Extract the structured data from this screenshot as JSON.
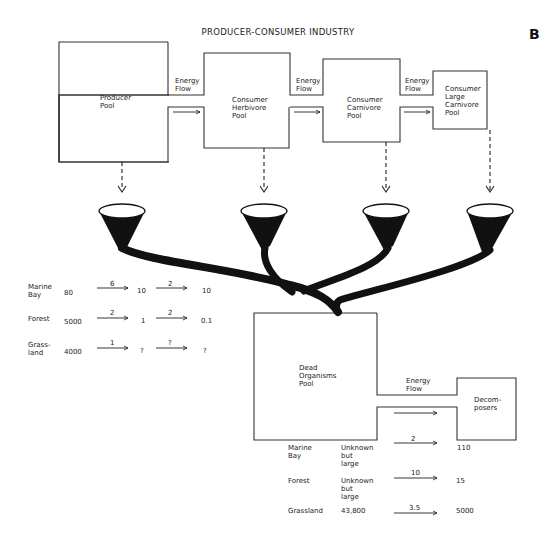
{
  "title": "PRODUCER-CONSUMER INDUSTRY",
  "panel_letter": "B",
  "pools": [
    {
      "id": "producer",
      "label": "Producer\nPool"
    },
    {
      "id": "herbivore",
      "label": "Consumer\nHerbivore\nPool"
    },
    {
      "id": "carnivore",
      "label": "Consumer\nCarnivore\nPool"
    },
    {
      "id": "large-carnivore",
      "label": "Consumer\nLarge\nCarnivore\nPool"
    },
    {
      "id": "dead",
      "label": "Dead\nOrganisms\nPool"
    },
    {
      "id": "decomposers",
      "label": "Decom-\nposers"
    }
  ],
  "energy_flow_label": "Energy\nFlow",
  "producer_consumer_table": {
    "rows": [
      {
        "ecosystem": "Marine\nBay",
        "producer": "80",
        "flow1": "6",
        "herbivore": "10",
        "flow2": "2",
        "carnivore": "10"
      },
      {
        "ecosystem": "Forest",
        "producer": "5000",
        "flow1": "2",
        "herbivore": "1",
        "flow2": "2",
        "carnivore": "0.1"
      },
      {
        "ecosystem": "Grass-\nland",
        "producer": "4000",
        "flow1": "1",
        "herbivore": "?",
        "flow2": "?",
        "carnivore": "?"
      }
    ]
  },
  "decomposer_table": {
    "rows": [
      {
        "ecosystem": "Marine\nBay",
        "dead_pool": "Unknown\nbut\nlarge",
        "flow": "2",
        "decomposers": "110"
      },
      {
        "ecosystem": "Forest",
        "dead_pool": "Unknown\nbut\nlarge",
        "flow": "10",
        "decomposers": "15"
      },
      {
        "ecosystem": "Grassland",
        "dead_pool": "43,800",
        "flow": "3.5",
        "decomposers": "5000"
      }
    ]
  }
}
